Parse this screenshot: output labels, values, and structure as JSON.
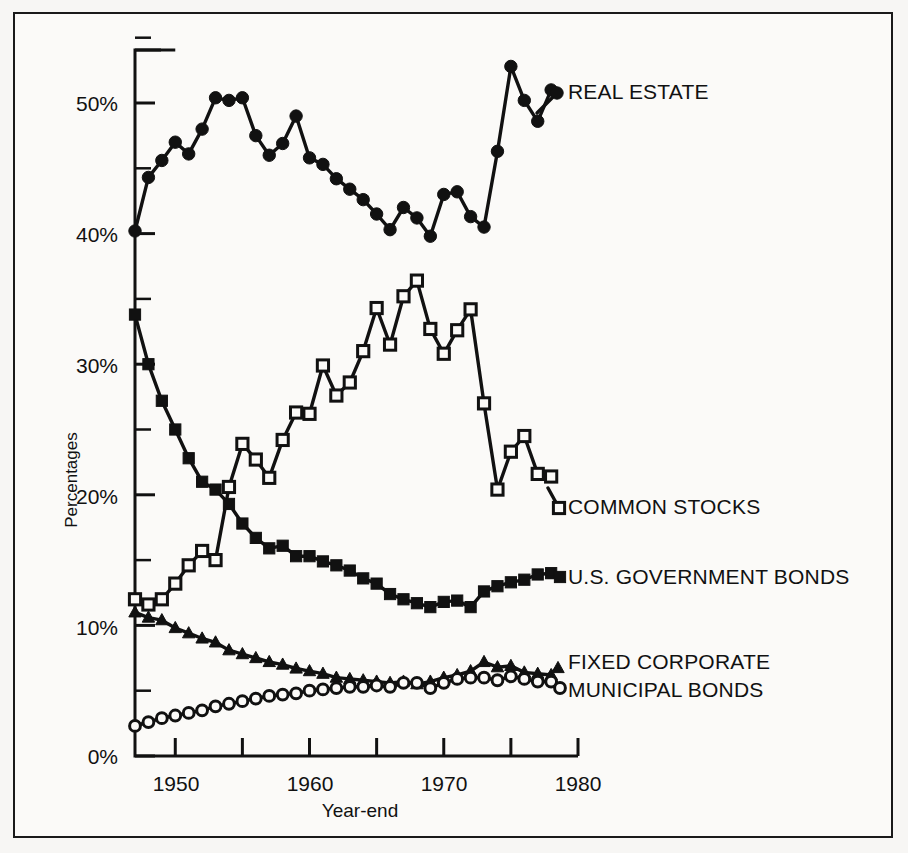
{
  "chart_data": {
    "type": "line",
    "title": "",
    "xlabel": "Year-end",
    "ylabel": "Percentages",
    "xlim": [
      1947,
      1980
    ],
    "ylim": [
      0,
      55
    ],
    "xticks": [
      1950,
      1955,
      1960,
      1965,
      1970,
      1975,
      1980
    ],
    "xtick_labels": [
      "1950",
      "",
      "1960",
      "",
      "1970",
      "",
      "1980"
    ],
    "yticks": [
      0,
      5,
      10,
      15,
      20,
      25,
      30,
      35,
      40,
      45,
      50,
      55
    ],
    "ytick_labels": [
      "0%",
      "",
      "10%",
      "",
      "20%",
      "",
      "30%",
      "",
      "40%",
      "",
      "50%",
      ""
    ],
    "grid": false,
    "legend_position": "right-inline",
    "x": [
      1947,
      1948,
      1949,
      1950,
      1951,
      1952,
      1953,
      1954,
      1955,
      1956,
      1957,
      1958,
      1959,
      1960,
      1961,
      1962,
      1963,
      1964,
      1965,
      1966,
      1967,
      1968,
      1969,
      1970,
      1971,
      1972,
      1973,
      1974,
      1975,
      1976,
      1977,
      1978
    ],
    "series": [
      {
        "name": "REAL ESTATE",
        "marker": "filled-circle",
        "values": [
          40.2,
          44.3,
          45.6,
          47.0,
          46.1,
          48.0,
          50.4,
          50.2,
          50.4,
          47.5,
          46.0,
          46.9,
          49.0,
          45.8,
          45.3,
          44.2,
          43.4,
          42.6,
          41.5,
          40.3,
          42.0,
          41.2,
          39.8,
          43.0,
          43.2,
          41.3,
          40.5,
          46.3,
          52.8,
          50.2,
          48.6,
          51.0
        ]
      },
      {
        "name": "COMMON STOCKS",
        "marker": "open-square",
        "values": [
          12.0,
          11.6,
          12.0,
          13.2,
          14.6,
          15.7,
          15.0,
          20.6,
          23.9,
          22.7,
          21.3,
          24.2,
          26.3,
          26.2,
          29.9,
          27.6,
          28.6,
          31.0,
          34.3,
          31.5,
          35.2,
          36.4,
          32.7,
          30.8,
          32.6,
          34.2,
          27.0,
          20.4,
          23.3,
          24.5,
          21.6,
          21.4
        ]
      },
      {
        "name": "U.S. GOVERNMENT BONDS",
        "marker": "filled-square",
        "values": [
          33.8,
          30.0,
          27.2,
          25.0,
          22.8,
          21.0,
          20.4,
          19.3,
          17.8,
          16.7,
          15.9,
          16.1,
          15.3,
          15.3,
          14.9,
          14.6,
          14.2,
          13.6,
          13.2,
          12.4,
          12.0,
          11.7,
          11.4,
          11.8,
          11.9,
          11.4,
          12.6,
          13.0,
          13.3,
          13.5,
          13.9,
          14.0
        ]
      },
      {
        "name": "FIXED CORPORATE",
        "marker": "filled-triangle",
        "values": [
          11.0,
          10.6,
          10.4,
          9.8,
          9.4,
          9.0,
          8.7,
          8.1,
          7.8,
          7.5,
          7.2,
          7.0,
          6.7,
          6.5,
          6.3,
          6.0,
          5.9,
          5.8,
          5.7,
          5.6,
          5.7,
          5.5,
          5.7,
          6.0,
          6.2,
          6.5,
          7.2,
          6.8,
          6.9,
          6.4,
          6.3,
          6.2
        ]
      },
      {
        "name": "MUNICIPAL BONDS",
        "marker": "open-circle",
        "values": [
          2.3,
          2.6,
          2.9,
          3.1,
          3.3,
          3.5,
          3.8,
          4.0,
          4.2,
          4.4,
          4.6,
          4.7,
          4.8,
          5.0,
          5.1,
          5.2,
          5.3,
          5.3,
          5.4,
          5.3,
          5.6,
          5.6,
          5.2,
          5.6,
          5.9,
          6.0,
          6.0,
          5.8,
          6.1,
          5.9,
          5.7,
          5.7
        ]
      }
    ]
  },
  "axis": {
    "ytick_labels": [
      {
        "text": "50%",
        "value": 50
      },
      {
        "text": "40%",
        "value": 40
      },
      {
        "text": "30%",
        "value": 30
      },
      {
        "text": "20%",
        "value": 20
      },
      {
        "text": "10%",
        "value": 10
      },
      {
        "text": "0%",
        "value": 0
      }
    ],
    "xtick_labels": [
      {
        "text": "1950",
        "value": 1950
      },
      {
        "text": "1960",
        "value": 1960
      },
      {
        "text": "1970",
        "value": 1970
      },
      {
        "text": "1980",
        "value": 1980
      }
    ],
    "ylabel": "Percentages",
    "xlabel": "Year-end"
  },
  "labels": {
    "real_estate": "REAL ESTATE",
    "common_stocks": "COMMON STOCKS",
    "us_government_bonds": "U.S. GOVERNMENT BONDS",
    "fixed_corporate": "FIXED CORPORATE",
    "municipal_bonds": "MUNICIPAL BONDS"
  },
  "colors": {
    "ink": "#111111",
    "paper": "#fbfaf8"
  }
}
